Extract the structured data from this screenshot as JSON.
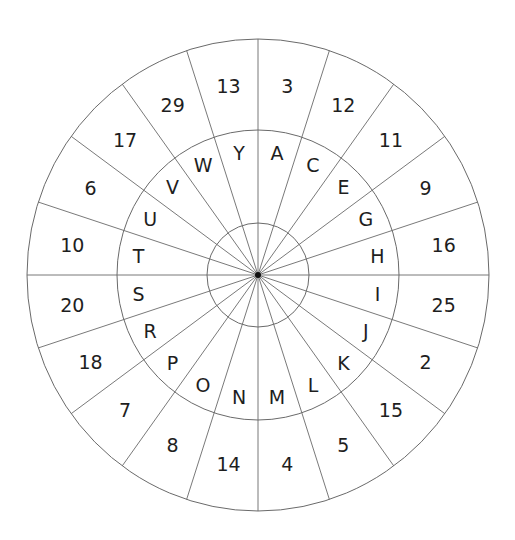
{
  "diagram": {
    "type": "cipher-wheel",
    "sectors": 20,
    "orientation": "clockwise from top",
    "inner_ring_letters": [
      "A",
      "C",
      "E",
      "G",
      "H",
      "I",
      "J",
      "K",
      "L",
      "M",
      "N",
      "O",
      "P",
      "R",
      "S",
      "T",
      "U",
      "V",
      "W",
      "Y"
    ],
    "outer_ring_numbers": [
      "3",
      "12",
      "11",
      "9",
      "16",
      "25",
      "2",
      "15",
      "5",
      "4",
      "14",
      "8",
      "7",
      "18",
      "20",
      "10",
      "6",
      "17",
      "29",
      "13"
    ],
    "colors": {
      "lines": "#6a6a6a",
      "text": "#1e1e1e",
      "center_dot": "#111111",
      "background": "#ffffff"
    }
  }
}
